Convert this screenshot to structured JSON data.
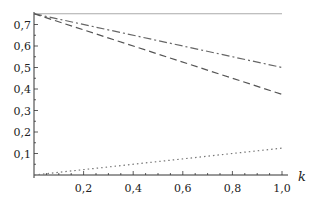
{
  "chart_data": {
    "type": "line",
    "title": "",
    "xlabel": "k",
    "ylabel": "",
    "xlim": [
      0,
      1.0
    ],
    "ylim": [
      0,
      0.8
    ],
    "grid": false,
    "legend": null,
    "x_ticks": [
      "0,2",
      "0,4",
      "0,6",
      "0,8",
      "1,0"
    ],
    "y_ticks": [
      "0,1",
      "0,2",
      "0,3",
      "0,4",
      "0,5",
      "0,6",
      "0,7"
    ],
    "series": [
      {
        "name": "solid",
        "style": "solid",
        "color": "#aaaaaa",
        "x": [
          0,
          1.0
        ],
        "values": [
          0.75,
          0.75
        ]
      },
      {
        "name": "dash-dot",
        "style": "dashdot",
        "color": "#666666",
        "x": [
          0,
          1.0
        ],
        "values": [
          0.75,
          0.5
        ]
      },
      {
        "name": "dashed",
        "style": "dashed",
        "color": "#555555",
        "x": [
          0,
          1.0
        ],
        "values": [
          0.75,
          0.375
        ]
      },
      {
        "name": "dotted",
        "style": "dotted",
        "color": "#777777",
        "x": [
          0,
          1.0
        ],
        "values": [
          0.0,
          0.125
        ]
      }
    ]
  }
}
